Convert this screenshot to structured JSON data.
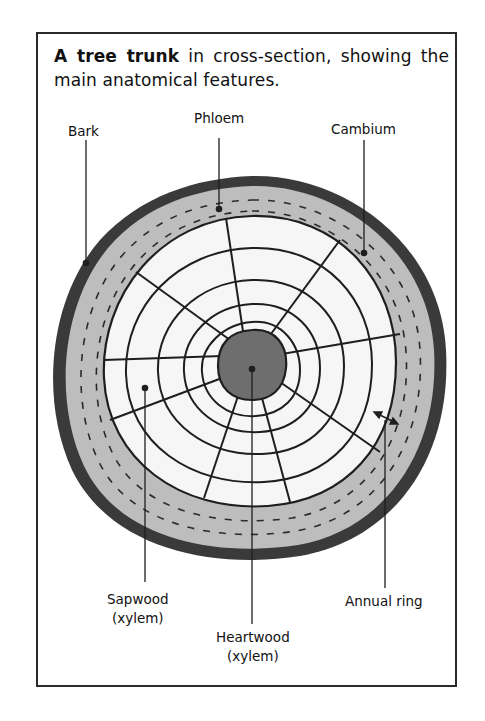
{
  "caption": {
    "bold": "A tree trunk",
    "rest": " in cross-section, showing the main anatomical features."
  },
  "labels": {
    "bark": "Bark",
    "phloem": "Phloem",
    "cambium": "Cambium",
    "sapwood_line1": "Sapwood",
    "sapwood_line2": "(xylem)",
    "heartwood_line1": "Heartwood",
    "heartwood_line2": "(xylem)",
    "annual_ring": "Annual ring"
  },
  "colors": {
    "bark": "#3a3a3a",
    "phloem": "#b9b9b9",
    "wood": "#f6f6f6",
    "heartwood": "#6e6e6e",
    "ink": "#1e1e1e"
  }
}
